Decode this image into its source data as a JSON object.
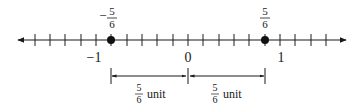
{
  "number_line": {
    "min_label": "−1",
    "zero_label": "0",
    "max_label": "1",
    "ticks_per_unit": 6,
    "points": [
      {
        "value": -0.8333,
        "sign": "−",
        "numerator": "5",
        "denominator": "6"
      },
      {
        "value": 0.8333,
        "sign": "",
        "numerator": "5",
        "denominator": "6"
      }
    ]
  },
  "distances": [
    {
      "numerator": "5",
      "denominator": "6",
      "unit": "unit"
    },
    {
      "numerator": "5",
      "denominator": "6",
      "unit": "unit"
    }
  ]
}
